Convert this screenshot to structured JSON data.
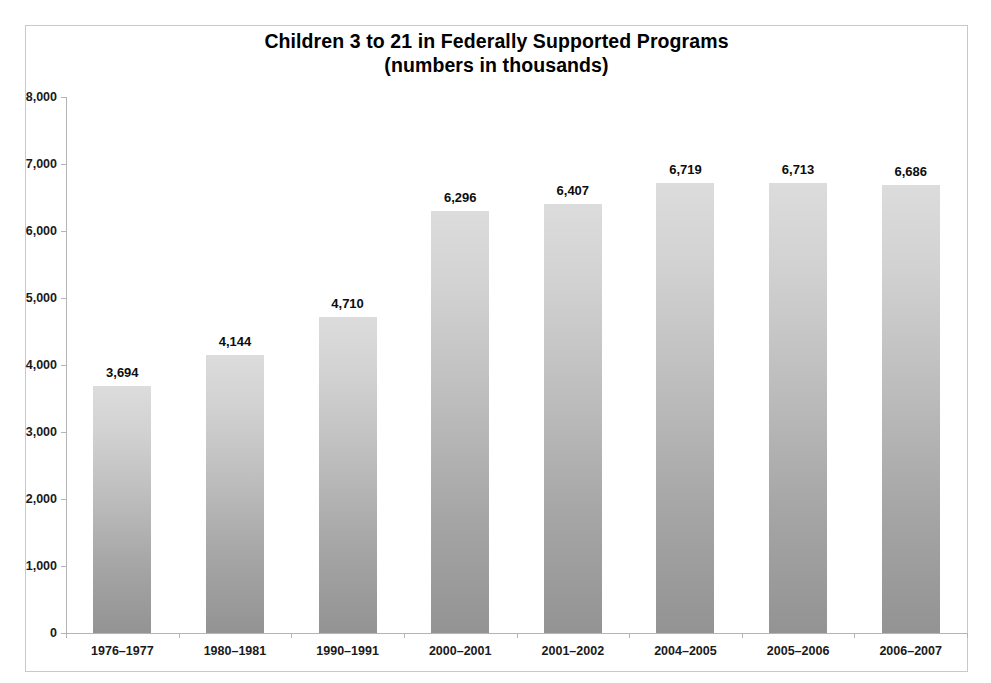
{
  "chart_data": {
    "type": "bar",
    "title": "Children 3 to 21 in Federally Supported Programs",
    "subtitle": "(numbers in thousands)",
    "title_lines": [
      "Children 3 to 21 in Federally Supported Programs",
      "(numbers in thousands)"
    ],
    "xlabel": "",
    "ylabel": "",
    "ylim": [
      0,
      8000
    ],
    "ytick_step": 1000,
    "grid": false,
    "legend": false,
    "legend_position": "none",
    "value_labels_shown": true,
    "bar_color_top": "#dcdcdc",
    "bar_color_bottom": "#939393",
    "axis_color": "#b4b4b4",
    "frame_color": "#c9c9c9",
    "background": "#ffffff",
    "categories": [
      "1976–1977",
      "1980–1981",
      "1990–1991",
      "2000–2001",
      "2001–2002",
      "2004–2005",
      "2005–2006",
      "2006–2007"
    ],
    "values": [
      3694,
      4144,
      4710,
      6296,
      6407,
      6719,
      6713,
      6686
    ],
    "value_labels": [
      "3,694",
      "4,144",
      "4,710",
      "6,296",
      "6,407",
      "6,719",
      "6,713",
      "6,686"
    ],
    "ytick_labels": [
      "0",
      "1,000",
      "2,000",
      "3,000",
      "4,000",
      "5,000",
      "6,000",
      "7,000",
      "8,000"
    ],
    "ytick_values": [
      0,
      1000,
      2000,
      3000,
      4000,
      5000,
      6000,
      7000,
      8000
    ]
  }
}
